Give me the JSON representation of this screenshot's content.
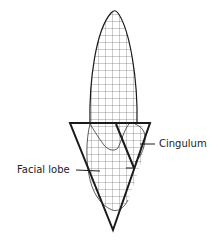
{
  "diagram": {
    "labels": {
      "cingulum": "Cingulum",
      "facial_lobe": "Facial lobe"
    },
    "colors": {
      "stroke": "#1a1a1a",
      "grid": "#555555",
      "background": "#ffffff"
    }
  }
}
